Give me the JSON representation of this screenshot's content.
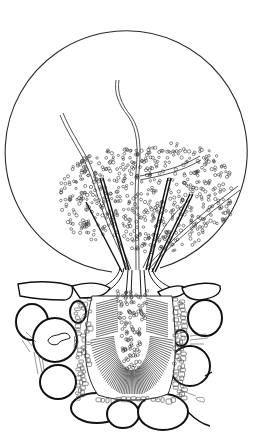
{
  "figure": {
    "title": "",
    "caption": "",
    "subject": "Scientific ink drawing of a fungal fruiting body (pycnidium) erupting through host plant tissue, discharging a mass of spores and hyphae within a circular outline",
    "colors": {
      "background": "#ffffff",
      "ink": "#1a1a1a",
      "light_ink": "#555555"
    },
    "parts": [
      {
        "id": "outer-circle",
        "label": "circular outline"
      },
      {
        "id": "spore-mass",
        "label": "spore mass"
      },
      {
        "id": "hyphae",
        "label": "hyphae"
      },
      {
        "id": "setae",
        "label": "dark setae"
      },
      {
        "id": "neck",
        "label": "ostiole neck"
      },
      {
        "id": "host-cells",
        "label": "host epidermal and cortical cells"
      },
      {
        "id": "pycnidium",
        "label": "pycnidium body with radiating conidiophores"
      }
    ]
  }
}
